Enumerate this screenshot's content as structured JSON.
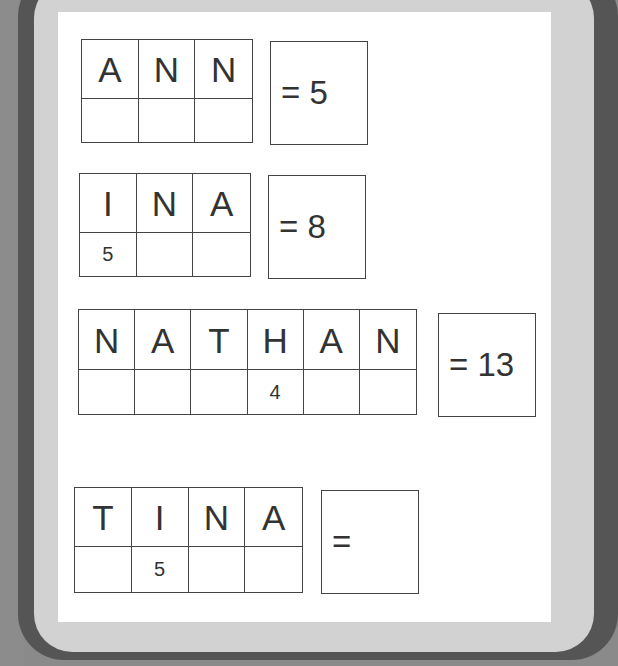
{
  "puzzles": [
    {
      "letters": [
        "A",
        "N",
        "N"
      ],
      "values": [
        "",
        "",
        ""
      ],
      "answer": "= 5"
    },
    {
      "letters": [
        "I",
        "N",
        "A"
      ],
      "values": [
        "5",
        "",
        ""
      ],
      "answer": "= 8"
    },
    {
      "letters": [
        "N",
        "A",
        "T",
        "H",
        "A",
        "N"
      ],
      "values": [
        "",
        "",
        "",
        "4",
        "",
        ""
      ],
      "answer": "= 13"
    },
    {
      "letters": [
        "T",
        "I",
        "N",
        "A"
      ],
      "values": [
        "",
        "5",
        "",
        ""
      ],
      "answer": "="
    }
  ]
}
